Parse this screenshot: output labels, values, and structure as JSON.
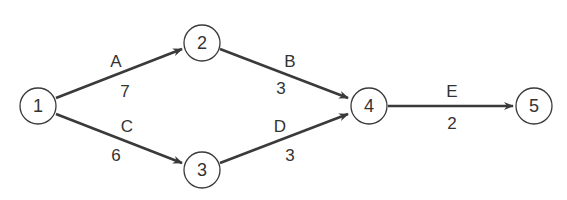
{
  "diagram": {
    "type": "activity-on-arrow network",
    "nodes": [
      {
        "id": "1",
        "label": "1",
        "x": 38,
        "y": 106
      },
      {
        "id": "2",
        "label": "2",
        "x": 202,
        "y": 43
      },
      {
        "id": "3",
        "label": "3",
        "x": 202,
        "y": 170
      },
      {
        "id": "4",
        "label": "4",
        "x": 369,
        "y": 106
      },
      {
        "id": "5",
        "label": "5",
        "x": 534,
        "y": 106
      }
    ],
    "edges": [
      {
        "from": "1",
        "to": "2",
        "activity": "A",
        "duration": "7"
      },
      {
        "from": "2",
        "to": "4",
        "activity": "B",
        "duration": "3"
      },
      {
        "from": "1",
        "to": "3",
        "activity": "C",
        "duration": "6"
      },
      {
        "from": "3",
        "to": "4",
        "activity": "D",
        "duration": "3"
      },
      {
        "from": "4",
        "to": "5",
        "activity": "E",
        "duration": "2"
      }
    ],
    "colors": {
      "stroke": "#3a3a3a",
      "text": "#333333",
      "background": "#ffffff"
    }
  }
}
